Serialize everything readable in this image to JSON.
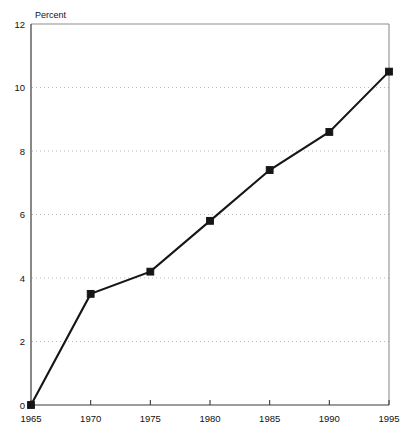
{
  "chart_data": {
    "type": "line",
    "title": "",
    "subtitle": "",
    "xlabel": "",
    "ylabel": "Percent",
    "x": [
      1965,
      1970,
      1975,
      1980,
      1985,
      1990,
      1995
    ],
    "categories": [
      "1965",
      "1970",
      "1975",
      "1980",
      "1985",
      "1990",
      "1995"
    ],
    "values": [
      0.0,
      3.5,
      4.2,
      5.8,
      7.4,
      8.6,
      10.5
    ],
    "series": [
      {
        "name": "Percent",
        "values": [
          0.0,
          3.5,
          4.2,
          5.8,
          7.4,
          8.6,
          10.5
        ]
      }
    ],
    "xlim": [
      1965,
      1995
    ],
    "ylim": [
      0,
      12
    ],
    "ytick_labels": [
      "0",
      "2",
      "4",
      "6",
      "8",
      "10",
      "12"
    ],
    "ytick_values": [
      0,
      2,
      4,
      6,
      8,
      10,
      12
    ],
    "xtick_labels": [
      "1965",
      "1970",
      "1975",
      "1980",
      "1985",
      "1990",
      "1995"
    ],
    "xtick_values": [
      1965,
      1970,
      1975,
      1980,
      1985,
      1990,
      1995
    ],
    "grid": "horizontal-dotted",
    "legend": "none",
    "marker": "square",
    "line_color": "#161616",
    "grid_color": "#b9b9b9",
    "axis_color": "#3a3a3a",
    "background": "#ffffff"
  },
  "axis": {
    "y_axis_title": "Percent"
  }
}
